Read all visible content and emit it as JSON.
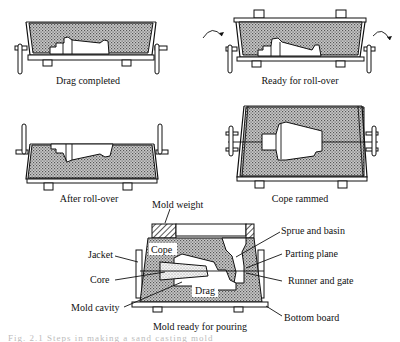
{
  "figure": {
    "panels": [
      {
        "id": "drag-completed",
        "caption": "Drag completed"
      },
      {
        "id": "ready-for-roll-over",
        "caption": "Ready for roll-over"
      },
      {
        "id": "after-roll-over",
        "caption": "After roll-over"
      },
      {
        "id": "cope-rammed",
        "caption": "Cope rammed"
      },
      {
        "id": "mold-ready",
        "caption": "Mold ready for pouring"
      }
    ],
    "labels": {
      "mold_weight": "Mold weight",
      "cope": "Cope",
      "drag": "Drag",
      "jacket": "Jacket",
      "core": "Core",
      "mold_cavity": "Mold cavity",
      "sprue_and_basin": "Sprue and basin",
      "parting_plane": "Parting plane",
      "runner_and_gate": "Runner and gate",
      "bottom_board": "Bottom board"
    },
    "bottom_caption_partial": "Fig. 2.1  Steps in making a sand casting mold"
  },
  "colors": {
    "ink": "#111111",
    "background": "#ffffff",
    "sand_shade": "#8a8a8a"
  }
}
